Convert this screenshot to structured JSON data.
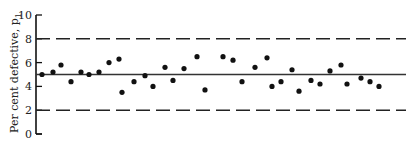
{
  "chart_data": {
    "type": "scatter",
    "title": "",
    "xlabel": "",
    "ylabel": "Per cent defective, p",
    "ylabel_subscript": "1",
    "ylim": [
      0,
      10
    ],
    "yticks": [
      0,
      2,
      4,
      6,
      8,
      10
    ],
    "ytick_labels": [
      "0",
      "2",
      "4",
      "6",
      "8",
      "10"
    ],
    "grid": false,
    "legend": null,
    "reference_lines": [
      {
        "name": "upper-control-limit",
        "value": 8,
        "style": "dashed"
      },
      {
        "name": "center-line",
        "value": 5,
        "style": "solid"
      },
      {
        "name": "lower-control-limit",
        "value": 2,
        "style": "dashed"
      }
    ],
    "series": [
      {
        "name": "samples",
        "x": [
          1,
          2,
          3,
          4,
          5,
          6,
          7,
          8,
          9,
          10,
          11,
          12,
          13,
          14,
          15,
          16,
          17,
          18,
          19,
          20,
          21,
          22,
          23,
          24,
          25,
          26,
          27,
          28,
          29,
          30,
          31,
          32,
          33,
          34,
          35
        ],
        "values": [
          5.0,
          5.2,
          5.8,
          4.4,
          5.2,
          5.0,
          5.2,
          6.0,
          6.3,
          3.5,
          4.4,
          4.9,
          4.0,
          5.6,
          4.5,
          5.5,
          6.5,
          3.7,
          6.5,
          6.2,
          4.4,
          5.6,
          6.4,
          4.0,
          4.4,
          5.4,
          3.6,
          4.5,
          4.2,
          5.3,
          5.8,
          4.2,
          4.7,
          4.4,
          4.0
        ]
      }
    ],
    "point_x_px": [
      42,
      53,
      61,
      71,
      81,
      89,
      99,
      109,
      119,
      122,
      134,
      145,
      153,
      165,
      173,
      184,
      197,
      205,
      223,
      233,
      242,
      255,
      267,
      272,
      281,
      292,
      299,
      311,
      320,
      330,
      341,
      347,
      361,
      370,
      379
    ]
  }
}
